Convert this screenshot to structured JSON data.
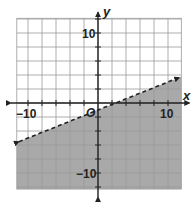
{
  "chart_data": {
    "type": "line",
    "title": "",
    "xlabel": "x",
    "ylabel": "y",
    "origin_label": "O",
    "x_tick_labels": [
      {
        "value": -10,
        "text": "−10"
      },
      {
        "value": 10,
        "text": "10"
      }
    ],
    "y_tick_labels": [
      {
        "value": 10,
        "text": "10"
      },
      {
        "value": -10,
        "text": "−10"
      }
    ],
    "xlim": [
      -11.6,
      11.9
    ],
    "ylim": [
      -12.3,
      12.1
    ],
    "grid": true,
    "grid_step": 2,
    "boundary_line": {
      "style": "dashed",
      "slope": 0.4,
      "intercept": -1,
      "x_range": [
        -11.3,
        11.6
      ],
      "arrows": "both"
    },
    "inequality": "y < (2/5)x - 1",
    "shaded_region": "below",
    "colors": {
      "shade": "#a9a9a9",
      "grid": "#9a9a9a",
      "axis": "#222222",
      "line": "#222222",
      "background": "#ffffff"
    }
  }
}
